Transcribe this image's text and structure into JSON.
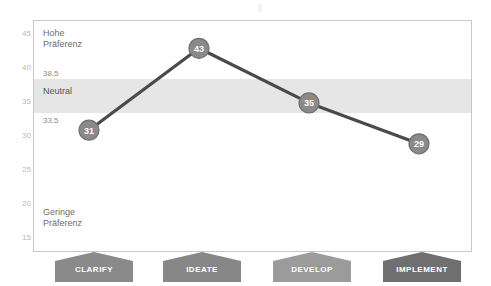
{
  "chart_data": {
    "type": "line",
    "title": "",
    "xlabel": "",
    "ylabel": "",
    "categories": [
      "CLARIFY",
      "IDEATE",
      "DEVELOP",
      "IMPLEMENT"
    ],
    "values": [
      31,
      43,
      35,
      29
    ],
    "point_labels": [
      "31",
      "43",
      "35",
      "29"
    ],
    "ylim": [
      13,
      47
    ],
    "yticks": [
      "45",
      "40",
      "35",
      "30",
      "25",
      "20",
      "15"
    ],
    "ytick_values": [
      45,
      40,
      35,
      30,
      25,
      20,
      15
    ],
    "grid": false,
    "legend": "none",
    "series": [
      {
        "name": "Präferenz",
        "values": [
          31,
          43,
          35,
          29
        ]
      }
    ],
    "bands": [
      {
        "name": "Neutral",
        "label": "Neutral",
        "upper_label": "38.5",
        "lower_label": "33.5",
        "upper": 38.5,
        "lower": 33.5,
        "color": "#e6e6e6"
      }
    ],
    "annotations": {
      "high_label": "Hohe\nPräferenz",
      "low_label": "Geringe\nPräferenz"
    },
    "colors": {
      "line": "#4a4a4a",
      "marker_fill": "#8a8a8a",
      "marker_stroke": "#6f6f6f",
      "marker_text": "#ffffff",
      "band": "#e6e6e6",
      "frame": "#c8c8c8",
      "tick_text": "#b9b9b9",
      "plot_text": "#6d6d6d"
    }
  },
  "axis": {
    "ticks": [
      "45",
      "40",
      "35",
      "30",
      "25",
      "20",
      "15"
    ]
  },
  "labels": {
    "high_line1": "Hohe",
    "high_line2": "Präferenz",
    "low_line1": "Geringe",
    "low_line2": "Präferenz",
    "neutral": "Neutral",
    "upper_threshold": "38.5",
    "lower_threshold": "33.5"
  },
  "phases": [
    {
      "label": "CLARIFY",
      "color": "#8a8a8a"
    },
    {
      "label": "IDEATE",
      "color": "#878787"
    },
    {
      "label": "DEVELOP",
      "color": "#9b9b9b"
    },
    {
      "label": "IMPLEMENT",
      "color": "#6f6f6f"
    }
  ],
  "points": [
    {
      "label": "31",
      "value": 31
    },
    {
      "label": "43",
      "value": 43
    },
    {
      "label": "35",
      "value": 35
    },
    {
      "label": "29",
      "value": 29
    }
  ]
}
